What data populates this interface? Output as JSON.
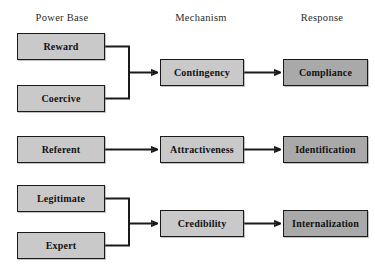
{
  "diagram": {
    "colors": {
      "node_light": "#c9c9c9",
      "node_dark": "#a9a9a9",
      "stroke": "#1a1a1a",
      "background": "#ffffff",
      "header_text": "#2b2b2b"
    },
    "headers": [
      {
        "label": "Power Base",
        "x": 62
      },
      {
        "label": "Mechanism",
        "x": 201
      },
      {
        "label": "Response",
        "x": 322
      }
    ],
    "nodes": [
      {
        "id": "reward",
        "label": "Reward",
        "column": "power-base",
        "shade": "light",
        "x": 17,
        "y": 33,
        "w": 88,
        "h": 27
      },
      {
        "id": "coercive",
        "label": "Coercive",
        "column": "power-base",
        "shade": "light",
        "x": 17,
        "y": 85,
        "w": 88,
        "h": 27
      },
      {
        "id": "contingency",
        "label": "Contingency",
        "column": "mechanism",
        "shade": "light",
        "x": 160,
        "y": 59,
        "w": 84,
        "h": 27
      },
      {
        "id": "compliance",
        "label": "Compliance",
        "column": "response",
        "shade": "dark",
        "x": 283,
        "y": 59,
        "w": 85,
        "h": 27
      },
      {
        "id": "referent",
        "label": "Referent",
        "column": "power-base",
        "shade": "light",
        "x": 17,
        "y": 136,
        "w": 88,
        "h": 27
      },
      {
        "id": "attractiveness",
        "label": "Attractiveness",
        "column": "mechanism",
        "shade": "light",
        "x": 160,
        "y": 136,
        "w": 84,
        "h": 27
      },
      {
        "id": "identification",
        "label": "Identification",
        "column": "response",
        "shade": "dark",
        "x": 283,
        "y": 136,
        "w": 85,
        "h": 27
      },
      {
        "id": "legitimate",
        "label": "Legitimate",
        "column": "power-base",
        "shade": "light",
        "x": 17,
        "y": 185,
        "w": 88,
        "h": 27
      },
      {
        "id": "expert",
        "label": "Expert",
        "column": "power-base",
        "shade": "light",
        "x": 17,
        "y": 232,
        "w": 88,
        "h": 27
      },
      {
        "id": "credibility",
        "label": "Credibility",
        "column": "mechanism",
        "shade": "light",
        "x": 160,
        "y": 210,
        "w": 84,
        "h": 27
      },
      {
        "id": "internalization",
        "label": "Internalization",
        "column": "response",
        "shade": "dark",
        "x": 283,
        "y": 210,
        "w": 85,
        "h": 27
      }
    ],
    "connectors": [
      {
        "id": "reward-coercive-to-contingency",
        "type": "bracket-merge",
        "from": [
          "reward",
          "coercive"
        ],
        "to": "contingency"
      },
      {
        "id": "contingency-to-compliance",
        "type": "arrow",
        "from": [
          "contingency"
        ],
        "to": "compliance"
      },
      {
        "id": "referent-to-attractiveness",
        "type": "arrow",
        "from": [
          "referent"
        ],
        "to": "attractiveness"
      },
      {
        "id": "attractiveness-to-identification",
        "type": "arrow",
        "from": [
          "attractiveness"
        ],
        "to": "identification"
      },
      {
        "id": "legitimate-expert-to-credibility",
        "type": "bracket-merge",
        "from": [
          "legitimate",
          "expert"
        ],
        "to": "credibility"
      },
      {
        "id": "credibility-to-internalization",
        "type": "arrow",
        "from": [
          "credibility"
        ],
        "to": "internalization"
      }
    ]
  }
}
